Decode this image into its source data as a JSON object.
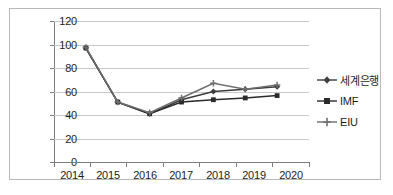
{
  "chart_data": {
    "type": "line",
    "title": "",
    "xlabel": "",
    "ylabel": "",
    "categories": [
      "2014",
      "2015",
      "2016",
      "2017",
      "2018",
      "2019",
      "2020"
    ],
    "ylim": [
      0,
      120
    ],
    "yticks": [
      "0",
      "20",
      "40",
      "60",
      "80",
      "100",
      "120"
    ],
    "grid": true,
    "legend_position": "right",
    "series": [
      {
        "name": "세계은행",
        "marker": "diamond",
        "color": "#3c3c3c",
        "values": [
          97,
          51,
          41,
          53,
          60,
          62,
          64
        ]
      },
      {
        "name": "IMF",
        "marker": "square",
        "color": "#2b2b2b",
        "values": [
          97,
          51,
          41,
          51,
          53,
          54.5,
          56.5
        ]
      },
      {
        "name": "EIU",
        "marker": "cross",
        "color": "#6e6e6e",
        "values": [
          97.5,
          51,
          42,
          54.5,
          67,
          62,
          65.5
        ]
      }
    ]
  },
  "axis": {
    "y_ticks": [
      "120",
      "100",
      "80",
      "60",
      "40",
      "20",
      "0"
    ],
    "x_ticks": [
      "2014",
      "2015",
      "2016",
      "2017",
      "2018",
      "2019",
      "2020"
    ]
  },
  "legend": {
    "items": [
      {
        "label": "세계은행"
      },
      {
        "label": "IMF"
      },
      {
        "label": "EIU"
      }
    ]
  }
}
